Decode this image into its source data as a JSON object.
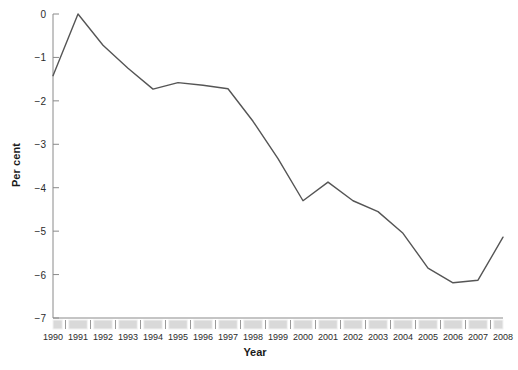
{
  "chart_data": {
    "type": "line",
    "title": "",
    "subtitle": "",
    "xlabel": "Year",
    "ylabel": "Per cent",
    "categories": [
      1990,
      1991,
      1992,
      1993,
      1994,
      1995,
      1996,
      1997,
      1998,
      1999,
      2000,
      2001,
      2002,
      2003,
      2004,
      2005,
      2006,
      2007,
      2008
    ],
    "values": [
      -1.42,
      0.0,
      -0.72,
      -1.25,
      -1.73,
      -1.58,
      -1.64,
      -1.72,
      -2.47,
      -3.33,
      -4.3,
      -3.87,
      -4.3,
      -4.55,
      -5.05,
      -5.85,
      -6.19,
      -6.13,
      -5.14
    ],
    "series": [
      {
        "name": "Per cent",
        "values": [
          -1.42,
          0.0,
          -0.72,
          -1.25,
          -1.73,
          -1.58,
          -1.64,
          -1.72,
          -2.47,
          -3.33,
          -4.3,
          -3.87,
          -4.3,
          -4.55,
          -5.05,
          -5.85,
          -6.19,
          -6.13,
          -5.14
        ],
        "color": "#555555"
      }
    ],
    "ylim": [
      -7,
      0
    ],
    "yticks": [
      0,
      -1,
      -2,
      -3,
      -4,
      -5,
      -6,
      -7
    ],
    "ytick_labels": [
      "0",
      "−1",
      "−2",
      "−3",
      "−4",
      "−5",
      "−6",
      "−7"
    ],
    "xtick_labels": [
      "1990",
      "1991",
      "1992",
      "1993",
      "1994",
      "1995",
      "1996",
      "1997",
      "1998",
      "1999",
      "2000",
      "2001",
      "2002",
      "2003",
      "2004",
      "2005",
      "2006",
      "2007",
      "2008"
    ],
    "grid": false,
    "legend": null,
    "legend_position": "none",
    "annotations": [],
    "colors": {
      "line": "#555555",
      "axis": "#8a8a8a",
      "tick_block_fill": "#d9d9d9",
      "tick_block_border": "#f2f2f2",
      "text": "#2b2b2b",
      "label_text": "#1a1a1a",
      "background": "#ffffff"
    }
  }
}
